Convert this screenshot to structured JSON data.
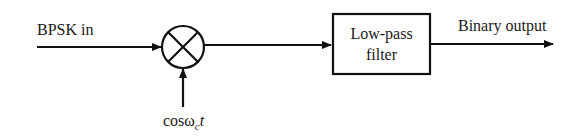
{
  "diagram": {
    "input": {
      "label": "BPSK in"
    },
    "mixer": {
      "symbol": "multiplier",
      "icon": "circle-x-multiplier-icon"
    },
    "reference": {
      "label_base": "cosω",
      "label_sub": "c",
      "label_tail": "t"
    },
    "filter": {
      "line1": "Low-pass",
      "line2": "filter"
    },
    "output": {
      "label": "Binary output"
    },
    "colors": {
      "stroke": "#111111",
      "background": "#ffffff",
      "text": "#1a1a1a"
    }
  }
}
